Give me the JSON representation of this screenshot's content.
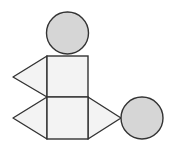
{
  "diagram": {
    "colors": {
      "stroke": "#333333",
      "circle_fill": "#d6d6d6",
      "face_fill": "#f3f3f3",
      "background": "#ffffff"
    },
    "circles": [
      {
        "name": "top-circle",
        "cx": 67.5,
        "cy": 33,
        "r": 21
      },
      {
        "name": "right-circle",
        "cx": 142,
        "cy": 118,
        "r": 21
      }
    ],
    "squares": [
      {
        "name": "upper-square",
        "x": 47,
        "y": 56,
        "w": 41,
        "h": 41
      },
      {
        "name": "lower-square",
        "x": 47,
        "y": 97,
        "w": 41,
        "h": 42
      }
    ],
    "triangles": [
      {
        "name": "upper-left-triangle",
        "points": "47,56 13,77 47,97"
      },
      {
        "name": "lower-left-triangle",
        "points": "47,97 13,118 47,139"
      },
      {
        "name": "lower-right-triangle",
        "points": "88,97 121,118 88,139"
      }
    ]
  }
}
